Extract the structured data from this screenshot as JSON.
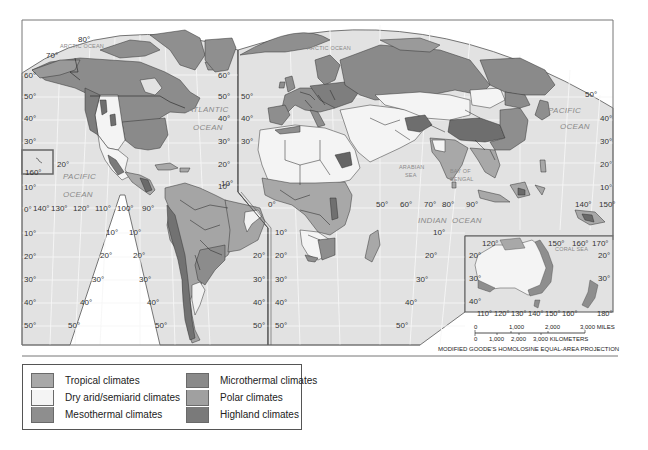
{
  "map": {
    "projection_note": "MODIFIED GOODE'S HOMOLOSINE EQUAL-AREA PROJECTION",
    "ocean_labels": {
      "arctic_west": "ARCTIC OCEAN",
      "arctic_east": "ARCTIC OCEAN",
      "atlantic_1": "ATLANTIC",
      "atlantic_2": "OCEAN",
      "pacific_west_1": "PACIFIC",
      "pacific_west_2": "OCEAN",
      "pacific_east_1": "PACIFIC",
      "pacific_east_2": "OCEAN",
      "indian_1": "INDIAN",
      "indian_2": "OCEAN",
      "arabian_1": "ARABIAN",
      "arabian_2": "SEA",
      "bengal_1": "BAY OF",
      "bengal_2": "BENGAL",
      "coral_sea": "CORAL SEA"
    },
    "lat_labels_left": [
      "60°",
      "50°",
      "40°",
      "30°",
      "20°",
      "10°",
      "0°",
      "10°",
      "20°",
      "30°",
      "40°",
      "50°"
    ],
    "lat_labels_na_right": [
      "60°",
      "50°",
      "40°",
      "30°",
      "20°",
      "10°"
    ],
    "lat_labels_eu_left": [
      "50°",
      "40°",
      "30°"
    ],
    "lat_labels_sa_left": [
      "10°",
      "20°",
      "30°",
      "40°",
      "50°"
    ],
    "lat_labels_sa_right": [
      "10°",
      "20°",
      "30°",
      "40°",
      "50°"
    ],
    "lat_labels_sa_east": [
      "20°",
      "30°",
      "40°",
      "50°"
    ],
    "lat_labels_af_left": [
      "10°",
      "20°",
      "30°",
      "40°",
      "50°"
    ],
    "lat_labels_af_right": [
      "10°",
      "20°",
      "30°",
      "40°",
      "50°"
    ],
    "lat_labels_asia_right": [
      "50°",
      "40°",
      "30°",
      "20°",
      "10°"
    ],
    "top_labels": {
      "deg80": "80°",
      "deg70": "70°",
      "hawaii": "160°",
      "hawaii_lat": "20°"
    },
    "equator_lon_labels_west": [
      "140°",
      "130°",
      "120°",
      "110°",
      "100°",
      "90°"
    ],
    "equator_lon_labels_east": [
      "0°",
      "50°",
      "60°",
      "70°",
      "80°",
      "90°"
    ],
    "equator_lon_labels_far_east": [
      "140°",
      "150°"
    ],
    "australia_inset": {
      "top_lon_labels": [
        "120°",
        "150°",
        "160°",
        "170°"
      ],
      "bottom_lon_labels": [
        "110°",
        "120°",
        "130°",
        "140°",
        "150°",
        "160°",
        "180°"
      ],
      "lat_left": [
        "20°",
        "30°",
        "40°"
      ],
      "lat_right": [
        "20°",
        "30°"
      ]
    },
    "scale_bar": {
      "miles_ticks": [
        "0",
        "1,000",
        "2,000",
        "3,000 MILES"
      ],
      "km_ticks": [
        "0",
        "1,000",
        "2,000",
        "3,000 KILOMETERS"
      ]
    }
  },
  "legend": {
    "items": [
      {
        "label": "Tropical climates",
        "color": "#a8a8a8"
      },
      {
        "label": "Dry arid/semiarid climates",
        "color": "#f4f4f4"
      },
      {
        "label": "Mesothermal climates",
        "color": "#8e8e8e"
      },
      {
        "label": "Microthermal climates",
        "color": "#8a8a8a"
      },
      {
        "label": "Polar climates",
        "color": "#a0a0a0"
      },
      {
        "label": "Highland climates",
        "color": "#7a7a7a"
      }
    ]
  },
  "colors": {
    "ocean": "#e2e2e2",
    "grid": "#f4f4f4",
    "frame": "#666666",
    "border": "#333333"
  }
}
